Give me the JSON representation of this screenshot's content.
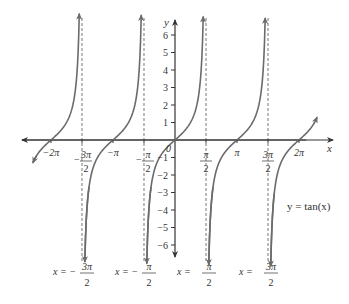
{
  "chart_data": {
    "type": "line",
    "title": "",
    "function_label": "y = tan(x)",
    "xlabel": "x",
    "ylabel": "y",
    "xlim": [
      -7.0,
      7.0
    ],
    "ylim": [
      -6.5,
      6.5
    ],
    "grid": false,
    "x_ticks": [
      {
        "value": -6.2832,
        "label": "−2π"
      },
      {
        "value": -4.7124,
        "label_num": "3π",
        "label_den": "2",
        "sign": "−"
      },
      {
        "value": -3.1416,
        "label": "−π"
      },
      {
        "value": -1.5708,
        "label_num": "π",
        "label_den": "2",
        "sign": "−"
      },
      {
        "value": 1.5708,
        "label_num": "π",
        "label_den": "2",
        "sign": ""
      },
      {
        "value": 3.1416,
        "label": "π"
      },
      {
        "value": 4.7124,
        "label_num": "3π",
        "label_den": "2",
        "sign": ""
      },
      {
        "value": 6.2832,
        "label": "2π"
      }
    ],
    "y_ticks": [
      6,
      5,
      4,
      3,
      2,
      1,
      -1,
      -2,
      -3,
      -4,
      -5,
      -6
    ],
    "origin_label": "0",
    "asymptotes": [
      {
        "x": -4.7124,
        "label": "x = −3π/2",
        "label_num": "3π",
        "label_den": "2",
        "sign": "−"
      },
      {
        "x": -1.5708,
        "label": "x = −π/2",
        "label_num": "π",
        "label_den": "2",
        "sign": "−"
      },
      {
        "x": 1.5708,
        "label": "x = π/2",
        "label_num": "π",
        "label_den": "2",
        "sign": ""
      },
      {
        "x": 4.7124,
        "label": "x = 3π/2",
        "label_num": "3π",
        "label_den": "2",
        "sign": ""
      }
    ],
    "series": [
      {
        "name": "tan(x) branch (-5π/2, -3π/2)",
        "x_range": [
          -7.853,
          -4.712
        ],
        "visible_range": [
          -7.2,
          -4.85
        ]
      },
      {
        "name": "tan(x) branch (-3π/2, -π/2)",
        "x_range": [
          -4.712,
          -1.571
        ],
        "visible_range": [
          -4.57,
          -1.71
        ]
      },
      {
        "name": "tan(x) branch (-π/2, π/2)",
        "x_range": [
          -1.571,
          1.571
        ],
        "visible_range": [
          -1.43,
          1.43
        ]
      },
      {
        "name": "tan(x) branch (π/2, 3π/2)",
        "x_range": [
          1.571,
          4.712
        ],
        "visible_range": [
          1.71,
          4.57
        ]
      },
      {
        "name": "tan(x) branch (3π/2, 5π/2)",
        "x_range": [
          4.712,
          7.853
        ],
        "visible_range": [
          4.85,
          7.2
        ]
      }
    ],
    "sample_points": [
      {
        "x": -6.2832,
        "y": 0
      },
      {
        "x": -3.1416,
        "y": 0
      },
      {
        "x": 0,
        "y": 0
      },
      {
        "x": 3.1416,
        "y": 0
      },
      {
        "x": 6.2832,
        "y": 0
      },
      {
        "x": 0.7854,
        "y": 1
      },
      {
        "x": -0.7854,
        "y": -1
      },
      {
        "x": 1.249,
        "y": 3
      },
      {
        "x": -1.249,
        "y": -3
      }
    ]
  },
  "colors": {
    "curve": "#6b6b6b",
    "axis": "#333333",
    "asymptote": "#777777",
    "text": "#333333"
  }
}
